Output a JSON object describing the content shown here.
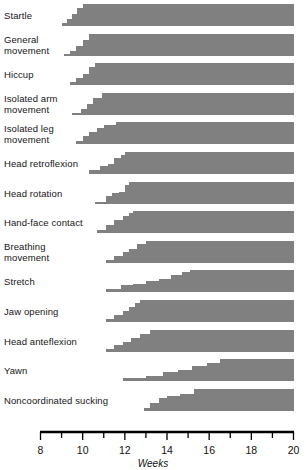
{
  "chart_data": {
    "type": "area",
    "title": "",
    "xlabel": "Weeks",
    "ylabel": "",
    "xlim": [
      8,
      20
    ],
    "grid": false,
    "legend": null,
    "x_ticks_major": [
      8,
      10,
      12,
      14,
      16,
      18,
      20
    ],
    "x_ticks_minor": [
      9,
      11,
      13,
      15,
      17,
      19
    ],
    "x_tick_labels": [
      "8",
      "10",
      "12",
      "14",
      "16",
      "18",
      "20"
    ],
    "bar_color": "#808080",
    "categories": [
      "Startle",
      "General movement",
      "Hiccup",
      "Isolated arm movement",
      "Isolated leg movement",
      "Head retroflexion",
      "Head rotation",
      "Hand-face contact",
      "Breathing movement",
      "Stretch",
      "Jaw opening",
      "Head anteflexion",
      "Yawn",
      "Noncoordinated sucking"
    ],
    "series": [
      {
        "name": "Startle",
        "label_lines": "Startle",
        "onset_week": 9.0,
        "plateau_week": 10.0,
        "steps": [
          {
            "week": 9.0,
            "level": 0.12
          },
          {
            "week": 9.25,
            "level": 0.3
          },
          {
            "week": 9.5,
            "level": 0.55
          },
          {
            "week": 9.75,
            "level": 0.82
          },
          {
            "week": 10.0,
            "level": 1.0
          },
          {
            "week": 20.0,
            "level": 1.0
          }
        ]
      },
      {
        "name": "General movement",
        "label_lines": "General\nmovement",
        "onset_week": 9.1,
        "plateau_week": 10.3,
        "steps": [
          {
            "week": 9.1,
            "level": 0.1
          },
          {
            "week": 9.4,
            "level": 0.22
          },
          {
            "week": 9.7,
            "level": 0.45
          },
          {
            "week": 10.0,
            "level": 0.72
          },
          {
            "week": 10.3,
            "level": 1.0
          },
          {
            "week": 20.0,
            "level": 1.0
          }
        ]
      },
      {
        "name": "Hiccup",
        "label_lines": "Hiccup",
        "onset_week": 9.4,
        "plateau_week": 10.6,
        "steps": [
          {
            "week": 9.4,
            "level": 0.12
          },
          {
            "week": 9.7,
            "level": 0.3
          },
          {
            "week": 10.0,
            "level": 0.52
          },
          {
            "week": 10.3,
            "level": 0.8
          },
          {
            "week": 10.6,
            "level": 1.0
          },
          {
            "week": 20.0,
            "level": 1.0
          }
        ]
      },
      {
        "name": "Isolated arm movement",
        "label_lines": "Isolated arm\nmovement",
        "onset_week": 9.5,
        "plateau_week": 10.9,
        "steps": [
          {
            "week": 9.5,
            "level": 0.1
          },
          {
            "week": 9.9,
            "level": 0.28
          },
          {
            "week": 10.2,
            "level": 0.5
          },
          {
            "week": 10.5,
            "level": 0.78
          },
          {
            "week": 10.9,
            "level": 1.0
          },
          {
            "week": 20.0,
            "level": 1.0
          }
        ]
      },
      {
        "name": "Isolated leg movement",
        "label_lines": "Isolated leg\nmovement",
        "onset_week": 9.7,
        "plateau_week": 11.6,
        "steps": [
          {
            "week": 9.7,
            "level": 0.12
          },
          {
            "week": 10.0,
            "level": 0.35
          },
          {
            "week": 10.3,
            "level": 0.55
          },
          {
            "week": 10.7,
            "level": 0.72
          },
          {
            "week": 11.0,
            "level": 0.85
          },
          {
            "week": 11.6,
            "level": 1.0
          },
          {
            "week": 20.0,
            "level": 1.0
          }
        ]
      },
      {
        "name": "Head retroflexion",
        "label_lines": "Head retroflexion",
        "onset_week": 10.3,
        "plateau_week": 12.0,
        "steps": [
          {
            "week": 10.3,
            "level": 0.18
          },
          {
            "week": 10.8,
            "level": 0.36
          },
          {
            "week": 11.2,
            "level": 0.46
          },
          {
            "week": 11.5,
            "level": 0.72
          },
          {
            "week": 11.8,
            "level": 0.86
          },
          {
            "week": 12.0,
            "level": 1.0
          },
          {
            "week": 20.0,
            "level": 1.0
          }
        ]
      },
      {
        "name": "Head rotation",
        "label_lines": "Head rotation",
        "onset_week": 10.6,
        "plateau_week": 12.2,
        "steps": [
          {
            "week": 10.6,
            "level": 0.1
          },
          {
            "week": 11.1,
            "level": 0.35
          },
          {
            "week": 11.4,
            "level": 0.5
          },
          {
            "week": 11.7,
            "level": 0.55
          },
          {
            "week": 12.0,
            "level": 0.88
          },
          {
            "week": 12.2,
            "level": 1.0
          },
          {
            "week": 20.0,
            "level": 1.0
          }
        ]
      },
      {
        "name": "Hand-face contact",
        "label_lines": "Hand-face contact",
        "onset_week": 10.7,
        "plateau_week": 12.4,
        "steps": [
          {
            "week": 10.7,
            "level": 0.15
          },
          {
            "week": 11.1,
            "level": 0.35
          },
          {
            "week": 11.5,
            "level": 0.6
          },
          {
            "week": 11.9,
            "level": 0.78
          },
          {
            "week": 12.2,
            "level": 0.92
          },
          {
            "week": 12.4,
            "level": 1.0
          },
          {
            "week": 20.0,
            "level": 1.0
          }
        ]
      },
      {
        "name": "Breathing movement",
        "label_lines": "Breathing\nmovement",
        "onset_week": 11.1,
        "plateau_week": 13.0,
        "steps": [
          {
            "week": 11.1,
            "level": 0.15
          },
          {
            "week": 11.5,
            "level": 0.3
          },
          {
            "week": 11.9,
            "level": 0.52
          },
          {
            "week": 12.2,
            "level": 0.62
          },
          {
            "week": 12.6,
            "level": 0.85
          },
          {
            "week": 13.0,
            "level": 1.0
          },
          {
            "week": 20.0,
            "level": 1.0
          }
        ]
      },
      {
        "name": "Stretch",
        "label_lines": "Stretch",
        "onset_week": 11.1,
        "plateau_week": 15.1,
        "steps": [
          {
            "week": 11.1,
            "level": 0.12
          },
          {
            "week": 11.8,
            "level": 0.3
          },
          {
            "week": 12.4,
            "level": 0.38
          },
          {
            "week": 13.0,
            "level": 0.5
          },
          {
            "week": 13.6,
            "level": 0.6
          },
          {
            "week": 14.2,
            "level": 0.78
          },
          {
            "week": 14.7,
            "level": 0.9
          },
          {
            "week": 15.1,
            "level": 1.0
          },
          {
            "week": 20.0,
            "level": 1.0
          }
        ]
      },
      {
        "name": "Jaw opening",
        "label_lines": "Jaw opening",
        "onset_week": 11.1,
        "plateau_week": 12.7,
        "steps": [
          {
            "week": 11.1,
            "level": 0.12
          },
          {
            "week": 11.5,
            "level": 0.3
          },
          {
            "week": 11.9,
            "level": 0.48
          },
          {
            "week": 12.2,
            "level": 0.66
          },
          {
            "week": 12.5,
            "level": 0.86
          },
          {
            "week": 12.7,
            "level": 1.0
          },
          {
            "week": 20.0,
            "level": 1.0
          }
        ]
      },
      {
        "name": "Head anteflexion",
        "label_lines": "Head anteflexion",
        "onset_week": 11.1,
        "plateau_week": 13.2,
        "steps": [
          {
            "week": 11.1,
            "level": 0.12
          },
          {
            "week": 11.5,
            "level": 0.3
          },
          {
            "week": 11.9,
            "level": 0.46
          },
          {
            "week": 12.3,
            "level": 0.62
          },
          {
            "week": 12.7,
            "level": 0.82
          },
          {
            "week": 13.2,
            "level": 1.0
          },
          {
            "week": 20.0,
            "level": 1.0
          }
        ]
      },
      {
        "name": "Yawn",
        "label_lines": "Yawn",
        "onset_week": 11.9,
        "plateau_week": 16.5,
        "steps": [
          {
            "week": 11.9,
            "level": 0.12
          },
          {
            "week": 13.0,
            "level": 0.25
          },
          {
            "week": 13.8,
            "level": 0.42
          },
          {
            "week": 14.5,
            "level": 0.52
          },
          {
            "week": 15.2,
            "level": 0.7
          },
          {
            "week": 15.9,
            "level": 0.8
          },
          {
            "week": 16.5,
            "level": 1.0
          },
          {
            "week": 20.0,
            "level": 1.0
          }
        ]
      },
      {
        "name": "Noncoordinated sucking",
        "label_lines": "Noncoordinated sucking",
        "onset_week": 12.9,
        "plateau_week": 15.3,
        "steps": [
          {
            "week": 12.9,
            "level": 0.15
          },
          {
            "week": 13.2,
            "level": 0.38
          },
          {
            "week": 13.6,
            "level": 0.58
          },
          {
            "week": 14.0,
            "level": 0.7
          },
          {
            "week": 14.6,
            "level": 0.78
          },
          {
            "week": 15.3,
            "level": 1.0
          },
          {
            "week": 20.0,
            "level": 1.0
          }
        ]
      }
    ]
  }
}
